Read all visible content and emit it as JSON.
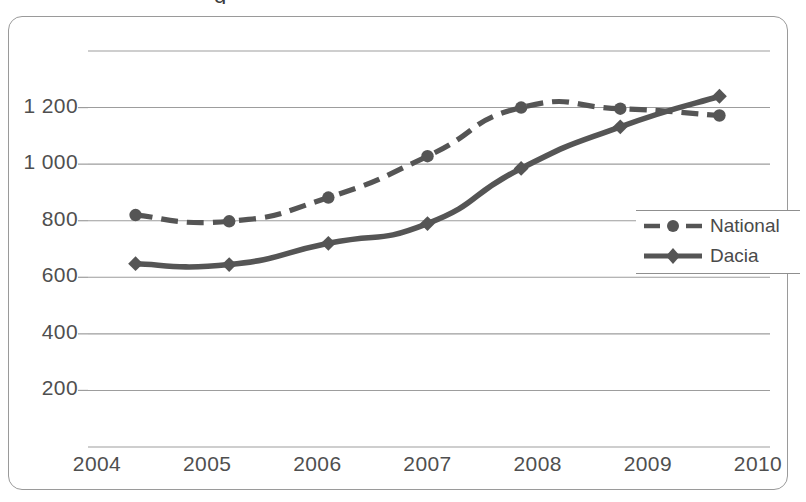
{
  "page": {
    "background": "#ffffff",
    "cropped_title_fragment": "g"
  },
  "chart_data": {
    "type": "line",
    "title": "",
    "subtitle": "",
    "xlabel": "",
    "ylabel": "",
    "grid": true,
    "gridlines_y": [
      0,
      200,
      400,
      600,
      800,
      1000,
      1200,
      1400
    ],
    "xlim": [
      2004,
      2010
    ],
    "ylim": [
      0,
      1400
    ],
    "x_tick_labels": [
      "2004",
      "2005",
      "2006",
      "2007",
      "2008",
      "2009",
      "2010"
    ],
    "x_ticks": [
      2004,
      2005,
      2006,
      2007,
      2008,
      2009,
      2010
    ],
    "y_tick_labels": [
      "1 200",
      "1 000",
      "800",
      "600",
      "400",
      "200"
    ],
    "y_ticks": [
      1200,
      1000,
      800,
      600,
      400,
      200
    ],
    "legend_position": "right-middle",
    "series": [
      {
        "name": "National",
        "style": "dashed",
        "marker": "circle",
        "color": "#555555",
        "x": [
          2004.35,
          2005.2,
          2006.1,
          2007.0,
          2007.85,
          2008.75,
          2009.65
        ],
        "values": [
          820,
          798,
          882,
          1028,
          1200,
          1196,
          1172
        ]
      },
      {
        "name": "Dacia",
        "style": "solid",
        "marker": "diamond",
        "color": "#555555",
        "x": [
          2004.35,
          2005.2,
          2006.1,
          2007.0,
          2007.85,
          2008.75,
          2009.65
        ],
        "values": [
          648,
          645,
          720,
          790,
          985,
          1132,
          1240
        ]
      }
    ]
  },
  "legend": {
    "items": [
      {
        "label": "National",
        "style": "dashed",
        "marker": "circle"
      },
      {
        "label": "Dacia",
        "style": "solid",
        "marker": "diamond"
      }
    ]
  },
  "colors": {
    "series": "#555555",
    "gridline": "#9d9d9d",
    "frame": "#9a9a9a",
    "text": "#4f4f4f"
  }
}
